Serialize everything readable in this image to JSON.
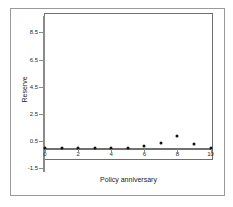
{
  "chart_data": {
    "type": "scatter",
    "title": "",
    "xlabel": "Policy anniversary",
    "ylabel": "Reserve",
    "x": [
      0,
      1,
      2,
      3,
      4,
      5,
      6,
      7,
      8,
      9,
      10
    ],
    "values": [
      0,
      0,
      0,
      0,
      0,
      0,
      0.12,
      0.35,
      0.85,
      0.3,
      0.02
    ],
    "series": [
      {
        "name": "Reserve",
        "points": [
          {
            "x": 0,
            "y": 0
          },
          {
            "x": 1,
            "y": 0
          },
          {
            "x": 2,
            "y": 0
          },
          {
            "x": 3,
            "y": 0
          },
          {
            "x": 4,
            "y": 0
          },
          {
            "x": 5,
            "y": 0
          },
          {
            "x": 6,
            "y": 0.12
          },
          {
            "x": 7,
            "y": 0.35
          },
          {
            "x": 8,
            "y": 0.85
          },
          {
            "x": 9,
            "y": 0.3
          },
          {
            "x": 10,
            "y": 0.02
          }
        ]
      }
    ],
    "xlim": [
      0,
      10
    ],
    "ylim": [
      -1.5,
      8.5
    ],
    "xticks": [
      "0",
      "2",
      "4",
      "6",
      "8",
      "10"
    ],
    "xtick_values": [
      0,
      2,
      4,
      6,
      8,
      10
    ],
    "yticks": [
      "8.5",
      "6.5",
      "4.5",
      "2.5",
      "0.5",
      "-1.5"
    ],
    "ytick_values": [
      8.5,
      6.5,
      4.5,
      2.5,
      0.5,
      -1.5
    ],
    "grid": false,
    "legend": null,
    "marker_color": "#111111",
    "axis_color": "#707070",
    "frame_color": "#9a9a9a",
    "background": "#ffffff"
  }
}
